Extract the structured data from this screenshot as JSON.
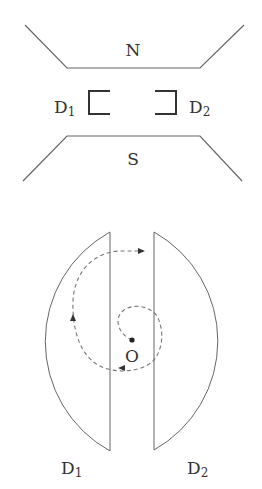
{
  "diagram": {
    "title_hidden": "Cyclotron schematic",
    "magnet": {
      "north_label": "N",
      "south_label": "S"
    },
    "side_view": {
      "d1_label": "D",
      "d1_sub": "1",
      "d2_label": "D",
      "d2_sub": "2"
    },
    "top_view": {
      "center_label": "O",
      "d1_label": "D",
      "d1_sub": "1",
      "d2_label": "D",
      "d2_sub": "2"
    },
    "colors": {
      "line": "#555555",
      "bracket": "#333333",
      "text": "#333333"
    }
  }
}
